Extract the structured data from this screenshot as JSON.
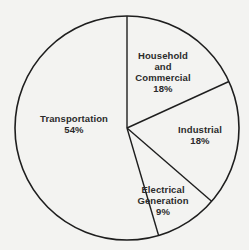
{
  "chart_data": {
    "type": "pie",
    "title": "",
    "start_angle_deg": 0,
    "direction": "clockwise",
    "slices": [
      {
        "label": "Household and Commercial",
        "label_lines": [
          "Household",
          "and",
          "Commercial"
        ],
        "value": 18,
        "value_label": "18%"
      },
      {
        "label": "Industrial",
        "label_lines": [
          "Industrial"
        ],
        "value": 18,
        "value_label": "18%"
      },
      {
        "label": "Electrical Generation",
        "label_lines": [
          "Electrical",
          "Generation"
        ],
        "value": 9,
        "value_label": "9%"
      },
      {
        "label": "Transportation",
        "label_lines": [
          "Transportation"
        ],
        "value": 54,
        "value_label": "54%"
      }
    ],
    "legend": "none",
    "fill": "none",
    "stroke_color": "#1e1e1e",
    "background_color": "#f3f3f1"
  },
  "labels": {
    "household": {
      "line1": "Household",
      "line2": "and",
      "line3": "Commercial",
      "pct": "18%"
    },
    "industrial": {
      "line1": "Industrial",
      "pct": "18%"
    },
    "electrical": {
      "line1": "Electrical",
      "line2": "Generation",
      "pct": "9%"
    },
    "transportation": {
      "line1": "Transportation",
      "pct": "54%"
    }
  }
}
